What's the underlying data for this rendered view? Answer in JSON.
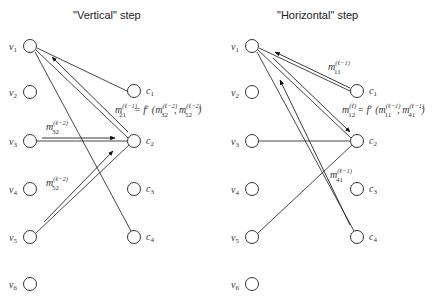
{
  "panels": [
    {
      "title": "\"Vertical\" step",
      "variable_nodes": [
        "v",
        "v",
        "v",
        "v",
        "v",
        "v"
      ],
      "variable_subs": [
        "1",
        "2",
        "3",
        "4",
        "5",
        "6"
      ],
      "check_nodes": [
        "c",
        "c",
        "c",
        "c"
      ],
      "check_subs": [
        "1",
        "2",
        "3",
        "4"
      ],
      "messages": [
        {
          "m": "m",
          "sup": "(ℓ−2)",
          "sub": "32"
        },
        {
          "m": "m",
          "sup": "(ℓ−2)",
          "sub": "52"
        }
      ],
      "formula": {
        "lhs_m": "m",
        "lhs_sup": "(ℓ−1)",
        "lhs_sub": "21",
        "eq": "= f",
        "f_sup": "c",
        "arg1_sup": "(ℓ−2)",
        "arg1_sub": "32",
        "arg2_sup": "(ℓ−2)",
        "arg2_sub": "52"
      }
    },
    {
      "title": "\"Horizontal\" step",
      "variable_nodes": [
        "v",
        "v",
        "v",
        "v",
        "v",
        "v"
      ],
      "variable_subs": [
        "1",
        "2",
        "3",
        "4",
        "5",
        "6"
      ],
      "check_nodes": [
        "c",
        "c",
        "c",
        "c"
      ],
      "check_subs": [
        "1",
        "2",
        "3",
        "4"
      ],
      "messages": [
        {
          "m": "m",
          "sup": "(ℓ−1)",
          "sub": "11"
        },
        {
          "m": "m",
          "sup": "(ℓ−1)",
          "sub": "41"
        }
      ],
      "formula": {
        "lhs_m": "m",
        "lhs_sup": "(ℓ)",
        "lhs_sub": "12",
        "eq": "= f",
        "f_sup": "v",
        "arg1_sup": "(ℓ−1)",
        "arg1_sub": "11",
        "arg2_sup": "(ℓ−1)",
        "arg2_sub": "41"
      }
    }
  ]
}
